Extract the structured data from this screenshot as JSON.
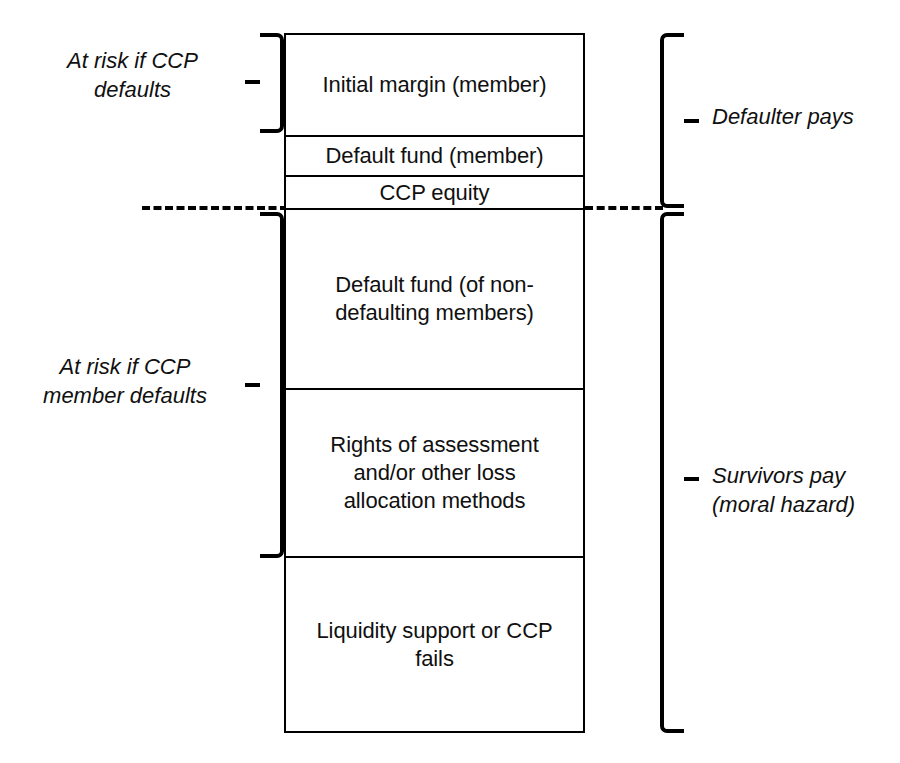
{
  "diagram": {
    "type": "layered-waterfall",
    "stroke_color": "#000000",
    "background_color": "#ffffff",
    "tiers": [
      {
        "id": "initial-margin",
        "label": "Initial margin (member)"
      },
      {
        "id": "default-fund-member",
        "label": "Default fund (member)"
      },
      {
        "id": "ccp-equity",
        "label": "CCP equity"
      },
      {
        "id": "default-fund-non-defaulting",
        "label": "Default fund (of non-\ndefaulting members)"
      },
      {
        "id": "rights-of-assessment",
        "label": "Rights of assessment\nand/or other loss\nallocation methods"
      },
      {
        "id": "liquidity-support",
        "label": "Liquidity support or CCP\nfails"
      }
    ],
    "annotations": {
      "left_upper": "At risk if CCP\ndefaults",
      "left_lower": "At risk if CCP\nmember defaults",
      "right_upper": "Defaulter pays",
      "right_lower": "Survivors pay\n(moral hazard)"
    },
    "separator": {
      "id": "dashed-divider",
      "style": "dashed",
      "meaning": "boundary between defaulter resources and survivor resources"
    }
  }
}
